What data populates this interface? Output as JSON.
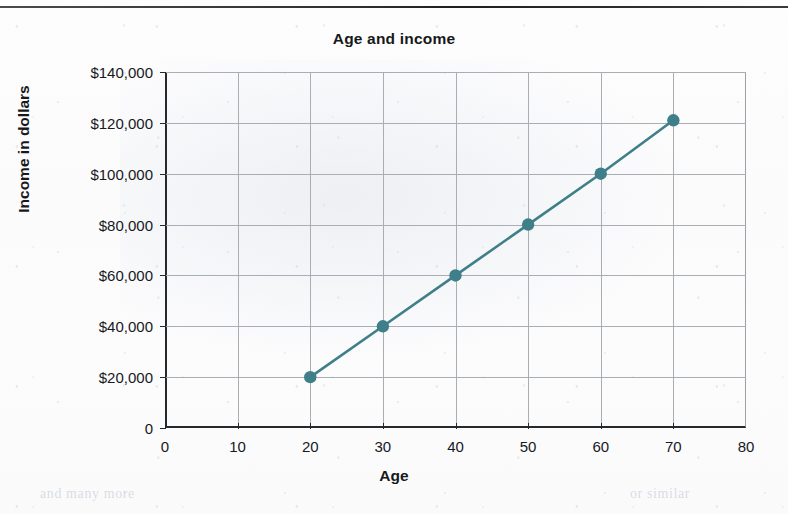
{
  "chart_data": {
    "type": "line",
    "title": "Age and income",
    "xlabel": "Age",
    "ylabel": "Income in dollars",
    "x": [
      20,
      30,
      40,
      50,
      60,
      70
    ],
    "values": [
      20000,
      40000,
      60000,
      80000,
      100000,
      121000
    ],
    "series": [
      {
        "name": "Income",
        "x": [
          20,
          30,
          40,
          50,
          60,
          70
        ],
        "values": [
          20000,
          40000,
          60000,
          80000,
          100000,
          121000
        ]
      }
    ],
    "xlim": [
      0,
      80
    ],
    "ylim": [
      0,
      140000
    ],
    "xticks": [
      0,
      10,
      20,
      30,
      40,
      50,
      60,
      70,
      80
    ],
    "yticks": [
      0,
      20000,
      40000,
      60000,
      80000,
      100000,
      120000,
      140000
    ],
    "xtick_labels": [
      "0",
      "10",
      "20",
      "30",
      "40",
      "50",
      "60",
      "70",
      "80"
    ],
    "ytick_labels": [
      "0",
      "$20,000",
      "$40,000",
      "$60,000",
      "$80,000",
      "$100,000",
      "$120,000",
      "$140,000"
    ],
    "grid": true,
    "legend": false,
    "legend_position": "none",
    "marker": "circle",
    "series_color": "#3f7f89",
    "grid_color": "#a9aeb4",
    "axis_color": "#26292c",
    "text_color": "#17191c"
  },
  "page": {
    "ghost_text_left": "and many more",
    "ghost_text_right": "or similar"
  }
}
